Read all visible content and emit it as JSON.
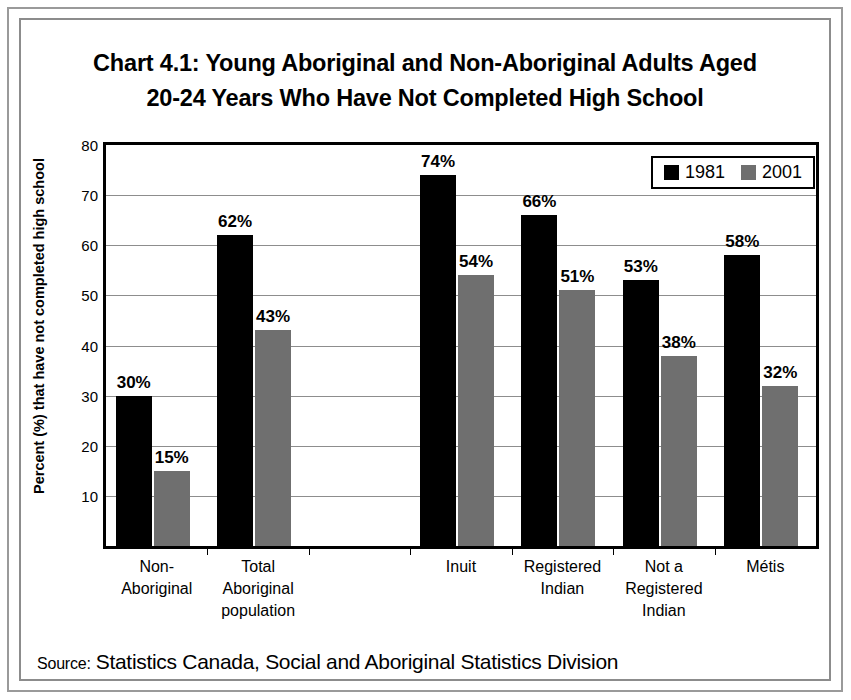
{
  "title": {
    "line1": "Chart 4.1: Young Aboriginal and Non-Aboriginal Adults Aged",
    "line2": "20-24 Years Who Have Not Completed High School"
  },
  "source": {
    "label": "Source:",
    "text": "Statistics Canada, Social and Aboriginal Statistics Division"
  },
  "legend": {
    "items": [
      {
        "label": "1981",
        "color": "#000000",
        "swatch": "legend-swatch-black"
      },
      {
        "label": "2001",
        "color": "#6f6f6f",
        "swatch": "legend-swatch-gray"
      }
    ]
  },
  "axis": {
    "y_title": "Percent (%) that have not completed high school",
    "y_ticks": [
      "10",
      "20",
      "30",
      "40",
      "50",
      "60",
      "70",
      "80"
    ]
  },
  "chart_data": {
    "type": "bar",
    "title": "Chart 4.1: Young Aboriginal and Non-Aboriginal Adults Aged 20-24 Years Who Have Not Completed High School",
    "xlabel": "",
    "ylabel": "Percent (%) that have not completed high school",
    "ylim": [
      0,
      80
    ],
    "ytick_step": 10,
    "grid": "horizontal",
    "legend_position": "top-right",
    "categories": [
      "Non-Aboriginal",
      "Total Aboriginal population",
      "",
      "Inuit",
      "Registered Indian",
      "Not a Registered Indian",
      "Métis"
    ],
    "category_lines": [
      [
        "Non-",
        "Aboriginal"
      ],
      [
        "Total",
        "Aboriginal",
        "population"
      ],
      [],
      [
        "Inuit"
      ],
      [
        "Registered",
        "Indian"
      ],
      [
        "Not a",
        "Registered",
        "Indian"
      ],
      [
        "Métis"
      ]
    ],
    "series": [
      {
        "name": "1981",
        "color": "#000000",
        "values": [
          30,
          62,
          null,
          74,
          66,
          53,
          58
        ],
        "labels": [
          "30%",
          "62%",
          "",
          "74%",
          "66%",
          "53%",
          "58%"
        ]
      },
      {
        "name": "2001",
        "color": "#6f6f6f",
        "values": [
          15,
          43,
          null,
          54,
          51,
          38,
          32
        ],
        "labels": [
          "15%",
          "43%",
          "",
          "54%",
          "51%",
          "38%",
          "32%"
        ]
      }
    ]
  }
}
